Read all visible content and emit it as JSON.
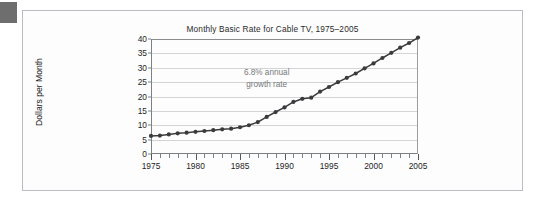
{
  "figure": {
    "title": "Monthly Basic Rate for Cable TV, 1975–2005",
    "annotation_line1": "6.8% annual",
    "annotation_line2": "growth rate",
    "frame_color": "#b9bcc0",
    "background_color": "#fdfdfd",
    "corner_mark_color": "#6e6e6e"
  },
  "chart_data": {
    "type": "line",
    "title": "Monthly Basic Rate for Cable TV, 1975–2005",
    "xlabel": "",
    "ylabel": "Dollars per Month",
    "xlim": [
      1975,
      2005
    ],
    "ylim": [
      0,
      40
    ],
    "grid": true,
    "legend": "none",
    "series_color": "#3b3b3d",
    "marker": "circle",
    "annotations": [
      {
        "text": "6.8% annual growth rate",
        "x": 1988,
        "y": 26
      }
    ],
    "y_ticks": [
      0,
      5,
      10,
      15,
      20,
      25,
      30,
      35,
      40
    ],
    "y_tick_labels": [
      "0",
      "5",
      "10",
      "15",
      "20",
      "25",
      "30",
      "35",
      "40"
    ],
    "x_ticks_major": [
      1975,
      1980,
      1985,
      1990,
      1995,
      2000,
      2005
    ],
    "x_tick_labels": [
      "1975",
      "1980",
      "1985",
      "1990",
      "1995",
      "2000",
      "2005"
    ],
    "x": [
      1975,
      1976,
      1977,
      1978,
      1979,
      1980,
      1981,
      1982,
      1983,
      1984,
      1985,
      1986,
      1987,
      1988,
      1989,
      1990,
      1991,
      1992,
      1993,
      1994,
      1995,
      1996,
      1997,
      1998,
      1999,
      2000,
      2001,
      2002,
      2003,
      2004,
      2005
    ],
    "values": [
      6.3,
      6.4,
      6.8,
      7.2,
      7.4,
      7.7,
      8.0,
      8.3,
      8.6,
      8.8,
      9.3,
      10.0,
      11.1,
      12.9,
      14.6,
      16.2,
      18.1,
      19.2,
      19.6,
      21.7,
      23.3,
      25.0,
      26.5,
      28.0,
      29.8,
      31.5,
      33.4,
      35.2,
      37.0,
      38.6,
      40.5
    ],
    "point_count": 31
  },
  "meta": {
    "y_axis_title": "Dollars per Month"
  }
}
